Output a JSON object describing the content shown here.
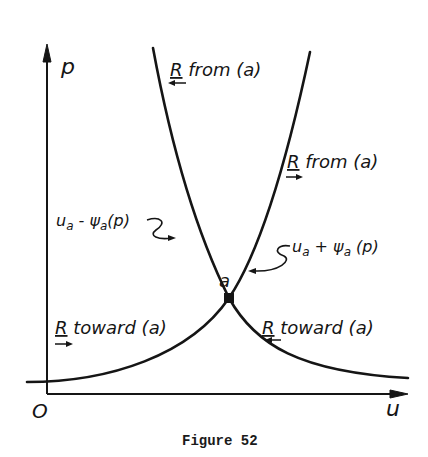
{
  "figure": {
    "caption": "Figure 52",
    "axes": {
      "x_label": "u",
      "y_label": "p",
      "origin_label": "O"
    },
    "point": {
      "label": "a"
    },
    "curves": {
      "left": {
        "label_main": "u",
        "label_sub": "a",
        "label_minus": " - ψ",
        "label_sub2": "a",
        "label_arg": "(p)"
      },
      "right": {
        "label_main": "u",
        "label_sub": "a",
        "label_plus": " + ψ",
        "label_sub2": "a",
        "label_arg": " (p)"
      }
    },
    "annotations": {
      "top_left": {
        "R": "R",
        "text": " from (a)",
        "arrow": "left"
      },
      "right_mid": {
        "R": "R",
        "text": " from (a)",
        "arrow": "right"
      },
      "bottom_left": {
        "R": "R",
        "text": " toward (a)",
        "arrow": "right"
      },
      "bottom_right": {
        "R": "R",
        "text": "  toward (a)",
        "arrow": "left"
      }
    },
    "colors": {
      "ink": "#151515",
      "background": "#ffffff"
    }
  }
}
